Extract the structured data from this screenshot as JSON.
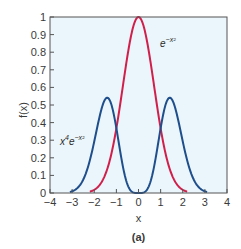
{
  "chart_data": {
    "type": "line",
    "title": "",
    "caption": "(a)",
    "xlabel": "x",
    "ylabel": "f(x)",
    "xlim": [
      -4,
      4
    ],
    "ylim": [
      0,
      1
    ],
    "xticks": [
      -4,
      -3,
      -2,
      -1,
      0,
      1,
      2,
      3,
      4
    ],
    "xtick_labels": [
      "−4",
      "−3",
      "−2",
      "−1",
      "0",
      "1",
      "2",
      "3",
      "4"
    ],
    "yticks": [
      0,
      0.1,
      0.2,
      0.3,
      0.4,
      0.5,
      0.6,
      0.7,
      0.8,
      0.9,
      1
    ],
    "ytick_labels": [
      "0",
      "0.1",
      "0.2",
      "0.3",
      "0.4",
      "0.5",
      "0.6",
      "0.7",
      "0.8",
      "0.9",
      "1"
    ],
    "grid": false,
    "background": "#eaf6fb",
    "series": [
      {
        "name": "e^{-x^2}",
        "label_text": "e",
        "label_sup": "−x²",
        "color": "#d11f4b",
        "function": "exp(-x^2)",
        "domain": [
          -2.2,
          2.2
        ],
        "x": [
          -2.2,
          -2,
          -1.5,
          -1,
          -0.5,
          0,
          0.5,
          1,
          1.5,
          2,
          2.2
        ],
        "values": [
          0.008,
          0.018,
          0.105,
          0.368,
          0.779,
          1.0,
          0.779,
          0.368,
          0.105,
          0.018,
          0.008
        ]
      },
      {
        "name": "x^4 e^{-x^2}",
        "label_text": "x",
        "label_sup1": "4",
        "label_mid": "e",
        "label_sup2": "−x²",
        "color": "#1f4e8c",
        "function": "x^4*exp(-x^2)",
        "domain": [
          -3.1,
          3.1
        ],
        "x": [
          -3,
          -2.5,
          -2,
          -1.414,
          -1,
          -0.5,
          0,
          0.5,
          1,
          1.414,
          2,
          2.5,
          3
        ],
        "values": [
          0.01,
          0.075,
          0.293,
          0.541,
          0.368,
          0.049,
          0.0,
          0.049,
          0.368,
          0.541,
          0.293,
          0.075,
          0.01
        ]
      }
    ]
  }
}
